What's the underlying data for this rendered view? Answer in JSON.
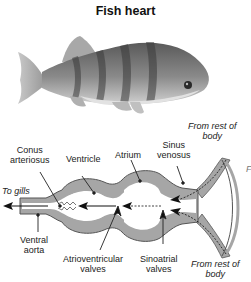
{
  "title": "Fish heart",
  "illustration": {
    "subject": "perch-fish-photo"
  },
  "labels": {
    "conus_arteriosus": [
      "Conus",
      "arteriosus"
    ],
    "ventricle": "Ventricle",
    "atrium": "Atrium",
    "sinus_venosus": [
      "Sinus",
      "venosus"
    ],
    "to_gills": "To gills",
    "ventral_aorta": [
      "Ventral",
      "aorta"
    ],
    "atrioventricular_valves": [
      "Atrioventricular",
      "valves"
    ],
    "sinoatrial_valves": [
      "Sinoatrial",
      "valves"
    ],
    "from_rest_top": [
      "From rest of",
      "body"
    ],
    "from_rest_bottom": [
      "From rest of",
      "body"
    ],
    "edge_fragment": "F"
  },
  "colors": {
    "wall": "#a6a6a6",
    "wall_outline": "#555555",
    "chamber": "#ffffff",
    "text": "#222222"
  }
}
